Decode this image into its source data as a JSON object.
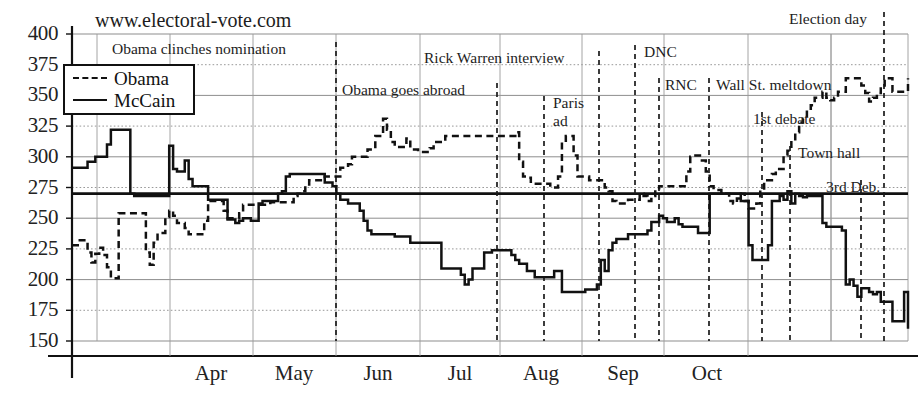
{
  "site_label": "www.electoral-vote.com",
  "legend": {
    "items": [
      {
        "name": "Obama",
        "style": "dashed"
      },
      {
        "name": "McCain",
        "style": "solid"
      }
    ]
  },
  "chart_data": {
    "type": "line",
    "title": "www.electoral-vote.com",
    "xlabel": "",
    "ylabel": "",
    "ylim": [
      137,
      400
    ],
    "yticks": [
      150,
      175,
      200,
      225,
      250,
      275,
      300,
      325,
      350,
      375,
      400
    ],
    "xticks": [
      "Apr",
      "May",
      "Jun",
      "Jul",
      "Aug",
      "Sep",
      "Oct"
    ],
    "grid": true,
    "legend_position": "upper-left",
    "threshold_line": 270,
    "series": [
      {
        "name": "Obama",
        "style": "dashed",
        "values": [
          228,
          228,
          232,
          232,
          222,
          214,
          221,
          226,
          220,
          210,
          201,
          201,
          254,
          254,
          254,
          254,
          254,
          254,
          254,
          222,
          212,
          230,
          238,
          238,
          251,
          256,
          252,
          246,
          246,
          242,
          237,
          237,
          237,
          237,
          248,
          264,
          264,
          264,
          264,
          256,
          250,
          250,
          250,
          254,
          261,
          261,
          261,
          261,
          261,
          261,
          261,
          263,
          263,
          263,
          263,
          263,
          263,
          268,
          270,
          272,
          276,
          281,
          281,
          281,
          281,
          284,
          284,
          284,
          284,
          291,
          291,
          294,
          300,
          300,
          300,
          300,
          306,
          306,
          317,
          317,
          331,
          322,
          312,
          308,
          308,
          308,
          315,
          306,
          306,
          304,
          304,
          304,
          307,
          312,
          312,
          312,
          317,
          317,
          317,
          317,
          317,
          317,
          317,
          317,
          317,
          317,
          317,
          317,
          317,
          317,
          317,
          317,
          317,
          317,
          320,
          296,
          284,
          283,
          278,
          278,
          278,
          278,
          278,
          275,
          275,
          284,
          312,
          317,
          317,
          301,
          284,
          284,
          284,
          281,
          281,
          281,
          281,
          275,
          272,
          264,
          262,
          262,
          262,
          265,
          265,
          265,
          270,
          268,
          264,
          268,
          273,
          276,
          276,
          276,
          276,
          276,
          276,
          276,
          288,
          300,
          301,
          301,
          297,
          288,
          276,
          273,
          273,
          270,
          270,
          264,
          262,
          266,
          270,
          264,
          258,
          258,
          262,
          273,
          281,
          281,
          286,
          290,
          290,
          301,
          305,
          313,
          320,
          328,
          331,
          338,
          342,
          348,
          348,
          353,
          348,
          346,
          348,
          353,
          353,
          364,
          364,
          364,
          364,
          358,
          352,
          345,
          348,
          352,
          358,
          364,
          364,
          353,
          353,
          353,
          353,
          364
        ]
      },
      {
        "name": "McCain",
        "style": "solid",
        "values": [
          291,
          291,
          291,
          291,
          296,
          296,
          300,
          300,
          300,
          310,
          322,
          322,
          322,
          322,
          322,
          270,
          268,
          268,
          268,
          268,
          268,
          268,
          268,
          268,
          268,
          309,
          290,
          288,
          288,
          297,
          282,
          276,
          276,
          276,
          276,
          265,
          265,
          265,
          265,
          265,
          249,
          249,
          246,
          248,
          250,
          250,
          248,
          248,
          262,
          264,
          264,
          264,
          264,
          270,
          272,
          284,
          286,
          286,
          286,
          286,
          286,
          286,
          286,
          286,
          286,
          279,
          279,
          276,
          270,
          265,
          265,
          262,
          262,
          262,
          256,
          248,
          240,
          237,
          237,
          237,
          237,
          237,
          237,
          235,
          235,
          235,
          235,
          230,
          230,
          230,
          230,
          230,
          230,
          230,
          230,
          209,
          209,
          209,
          209,
          209,
          204,
          196,
          200,
          209,
          209,
          209,
          222,
          222,
          224,
          224,
          224,
          224,
          224,
          220,
          216,
          213,
          213,
          207,
          207,
          202,
          202,
          202,
          202,
          202,
          207,
          207,
          190,
          190,
          190,
          190,
          190,
          190,
          192,
          192,
          192,
          196,
          216,
          207,
          224,
          230,
          233,
          233,
          233,
          237,
          237,
          237,
          237,
          237,
          240,
          247,
          247,
          252,
          250,
          247,
          247,
          250,
          245,
          243,
          243,
          243,
          243,
          238,
          238,
          238,
          270,
          270,
          270,
          270,
          270,
          270,
          270,
          270,
          264,
          264,
          228,
          216,
          216,
          216,
          216,
          228,
          264,
          264,
          268,
          265,
          272,
          262,
          270,
          268,
          267,
          268,
          268,
          268,
          268,
          246,
          243,
          243,
          243,
          243,
          240,
          196,
          200,
          195,
          186,
          193,
          193,
          190,
          188,
          190,
          182,
          182,
          182,
          166,
          166,
          166,
          190,
          160
        ]
      }
    ],
    "annotations": [
      {
        "text": "Obama clinches nomination",
        "x_px": 336,
        "label_x": 112,
        "label_y": 40,
        "line_top": 42,
        "line_bottom": 341
      },
      {
        "text": "Obama goes abroad",
        "x_px": 497,
        "label_x": 342,
        "label_y": 81,
        "line_top": 83,
        "line_bottom": 341
      },
      {
        "text": "Rick Warren interview",
        "x_px": 599,
        "label_x": 424,
        "label_y": 49,
        "line_top": 51,
        "line_bottom": 341
      },
      {
        "text": "Paris ad",
        "x_px": 544,
        "label_x": 553,
        "label_y": 94,
        "line_top": 96,
        "line_bottom": 341
      },
      {
        "text": "DNC",
        "x_px": 635,
        "label_x": 644,
        "label_y": 43,
        "line_top": 45,
        "line_bottom": 341
      },
      {
        "text": "RNC",
        "x_px": 659,
        "label_x": 665,
        "label_y": 76,
        "line_top": 78,
        "line_bottom": 341
      },
      {
        "text": "Wall St. meltdown",
        "x_px": 709,
        "label_x": 716,
        "label_y": 76,
        "line_top": 78,
        "line_bottom": 341
      },
      {
        "text": "1st debate",
        "x_px": 762,
        "label_x": 753,
        "label_y": 110,
        "line_top": 112,
        "line_bottom": 341
      },
      {
        "text": "Town hall",
        "x_px": 790,
        "label_x": 798,
        "label_y": 144,
        "line_top": 146,
        "line_bottom": 341
      },
      {
        "text": "3rd Deb.",
        "x_px": 861,
        "label_x": 826,
        "label_y": 178,
        "line_top": 180,
        "line_bottom": 341
      },
      {
        "text": "Election day",
        "x_px": 884,
        "label_x": 789,
        "label_y": 10,
        "line_top": 12,
        "line_bottom": 341
      }
    ],
    "vgrid_px": [
      72,
      97,
      170,
      253,
      336,
      420,
      500,
      582,
      664,
      748,
      831
    ],
    "month_tick_px": [
      170,
      253,
      336,
      420,
      500,
      582,
      664,
      748
    ],
    "month_label_px": [
      170,
      253,
      336,
      420,
      500,
      582,
      664
    ]
  }
}
